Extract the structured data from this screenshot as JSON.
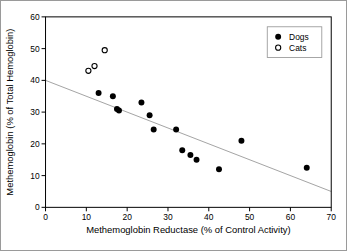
{
  "figure": {
    "background": "#ffffff",
    "border_color": "#9a9a9a"
  },
  "chart_data": {
    "type": "scatter",
    "title": "",
    "xlabel": "Methemoglobin Reductase (% of Control Activity)",
    "ylabel": "Methemoglobin (% of Total Hemoglobin)",
    "xlim": [
      0,
      70
    ],
    "ylim": [
      0,
      60
    ],
    "xticks": [
      0,
      10,
      20,
      30,
      40,
      50,
      60,
      70
    ],
    "yticks": [
      0,
      10,
      20,
      30,
      40,
      50,
      60
    ],
    "grid": false,
    "frame": true,
    "axis_color": "#000000",
    "text_color": "#000000",
    "legend": {
      "position": "top-right",
      "entries": [
        {
          "label": "Dogs",
          "marker": "filled-circle"
        },
        {
          "label": "Cats",
          "marker": "open-circle"
        }
      ]
    },
    "series": [
      {
        "name": "Dogs",
        "marker": "filled-circle",
        "color": "#000000",
        "points": [
          [
            13,
            36
          ],
          [
            16.5,
            35
          ],
          [
            17.5,
            31
          ],
          [
            18,
            30.5
          ],
          [
            23.5,
            33
          ],
          [
            25.5,
            29
          ],
          [
            26.5,
            24.5
          ],
          [
            32,
            24.5
          ],
          [
            33.5,
            18
          ],
          [
            35.5,
            16.5
          ],
          [
            37,
            15
          ],
          [
            42.5,
            12
          ],
          [
            48,
            21
          ],
          [
            64,
            12.5
          ]
        ]
      },
      {
        "name": "Cats",
        "marker": "open-circle",
        "color": "#000000",
        "points": [
          [
            10.5,
            43
          ],
          [
            12,
            44.5
          ],
          [
            14.5,
            49.5
          ]
        ]
      }
    ],
    "regression_line": {
      "x1": 0,
      "y1": 40,
      "x2": 70,
      "y2": 5,
      "color": "#8c8c8c"
    }
  }
}
